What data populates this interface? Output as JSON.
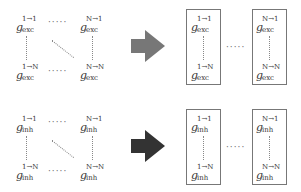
{
  "colors": {
    "exc_arrow": "#777777",
    "inh_arrow": "#333333",
    "box_border": "#777777"
  },
  "exc": {
    "label": "exc",
    "matrix": {
      "top_left": {
        "sup": "1→1",
        "sub": "exc"
      },
      "top_right": {
        "sup": "N→1",
        "sub": "exc"
      },
      "bottom_left": {
        "sup": "1→N",
        "sub": "exc"
      },
      "bottom_right": {
        "sup": "N→N",
        "sub": "exc"
      }
    },
    "columns": [
      {
        "top": {
          "sup": "1→1",
          "sub": "exc"
        },
        "bottom": {
          "sup": "1→N",
          "sub": "exc"
        }
      },
      {
        "top": {
          "sup": "N→1",
          "sub": "exc"
        },
        "bottom": {
          "sup": "N→N",
          "sub": "exc"
        }
      }
    ]
  },
  "inh": {
    "label": "inh",
    "matrix": {
      "top_left": {
        "sup": "1→1",
        "sub": "inh"
      },
      "top_right": {
        "sup": "N→1",
        "sub": "inh"
      },
      "bottom_left": {
        "sup": "1→N",
        "sub": "inh"
      },
      "bottom_right": {
        "sup": "N→N",
        "sub": "inh"
      }
    },
    "columns": [
      {
        "top": {
          "sup": "1→1",
          "sub": "inh"
        },
        "bottom": {
          "sup": "1→N",
          "sub": "inh"
        }
      },
      {
        "top": {
          "sup": "N→1",
          "sub": "inh"
        },
        "bottom": {
          "sup": "N→N",
          "sub": "inh"
        }
      }
    ]
  },
  "symbol": "g",
  "hdots": "·····"
}
